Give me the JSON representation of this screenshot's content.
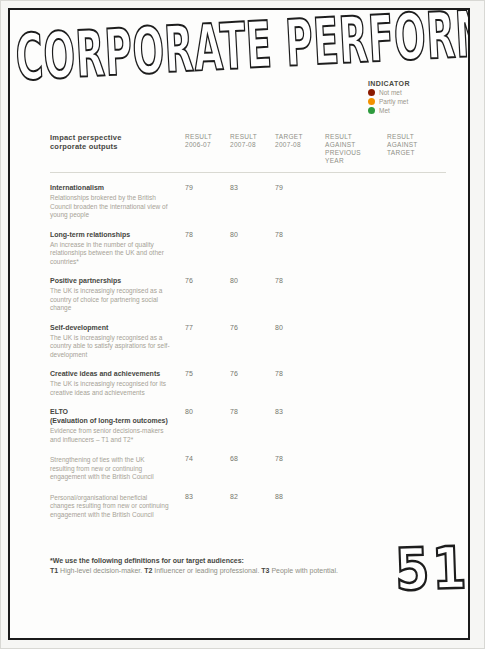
{
  "page": {
    "title": "CORPORATE PERFORMANCE",
    "page_number": "51"
  },
  "colors": {
    "not": "#8b1a00",
    "partly": "#f29100",
    "met": "#2e9b3e"
  },
  "legend": {
    "title": "INDICATOR",
    "items": [
      {
        "label": "Not met",
        "status": "not"
      },
      {
        "label": "Partly met",
        "status": "partly"
      },
      {
        "label": "Met",
        "status": "met"
      }
    ]
  },
  "table": {
    "headers": {
      "col1": [
        "Impact perspective",
        "corporate outputs"
      ],
      "col2": [
        "RESULT",
        "2006-07"
      ],
      "col3": [
        "RESULT",
        "2007-08"
      ],
      "col4": [
        "TARGET",
        "2007-08"
      ],
      "col5": [
        "RESULT AGAINST",
        "PREVIOUS YEAR"
      ],
      "col6": [
        "RESULT",
        "AGAINST TARGET"
      ]
    },
    "rows": [
      {
        "name": "Internationalism",
        "description": "Relationships brokered by the British Council broaden the international view of young people",
        "result_2006_07": "79",
        "result_2007_08": "83",
        "target_2007_08": "79",
        "against_previous_year": "met",
        "against_target": "met"
      },
      {
        "name": "Long-term relationships",
        "description": "An increase in the number of quality relationships between the UK and other countries*",
        "result_2006_07": "78",
        "result_2007_08": "80",
        "target_2007_08": "78",
        "against_previous_year": "met",
        "against_target": "met"
      },
      {
        "name": "Positive partnerships",
        "description": "The UK is increasingly recognised as a country of choice for partnering social change",
        "result_2006_07": "76",
        "result_2007_08": "80",
        "target_2007_08": "78",
        "against_previous_year": "met",
        "against_target": "met"
      },
      {
        "name": "Self-development",
        "description": "The UK is increasingly recognised as a country able to satisfy aspirations for self-development",
        "result_2006_07": "77",
        "result_2007_08": "76",
        "target_2007_08": "80",
        "against_previous_year": "partly",
        "against_target": "not"
      },
      {
        "name": "Creative ideas and achievements",
        "description": "The UK is increasingly recognised for its creative ideas and achievements",
        "result_2006_07": "75",
        "result_2007_08": "76",
        "target_2007_08": "78",
        "against_previous_year": "met",
        "against_target": "partly"
      },
      {
        "name": "ELTO\n(Evaluation of long-term outcomes)",
        "description": "Evidence from senior decisions-makers and influencers – T1 and T2*",
        "result_2006_07": "80",
        "result_2007_08": "78",
        "target_2007_08": "83",
        "against_previous_year": "partly",
        "against_target": "not"
      },
      {
        "name": "",
        "description": "Strengthening of ties with the UK resulting from new or continuing engagement with the British Council",
        "result_2006_07": "74",
        "result_2007_08": "68",
        "target_2007_08": "78",
        "against_previous_year": "not",
        "against_target": "not"
      },
      {
        "name": "",
        "description": "Personal/organisational beneficial changes resulting from new or continuing engagement with the British Council",
        "result_2006_07": "83",
        "result_2007_08": "82",
        "target_2007_08": "88",
        "against_previous_year": "partly",
        "against_target": "not"
      }
    ]
  },
  "footnote": {
    "heading": "*We use the following definitions for our target audiences:",
    "definitions": [
      {
        "term": "T1",
        "text": " High-level decision-maker. "
      },
      {
        "term": "T2",
        "text": " Influencer or leading professional. "
      },
      {
        "term": "T3",
        "text": " People with potential."
      }
    ]
  }
}
